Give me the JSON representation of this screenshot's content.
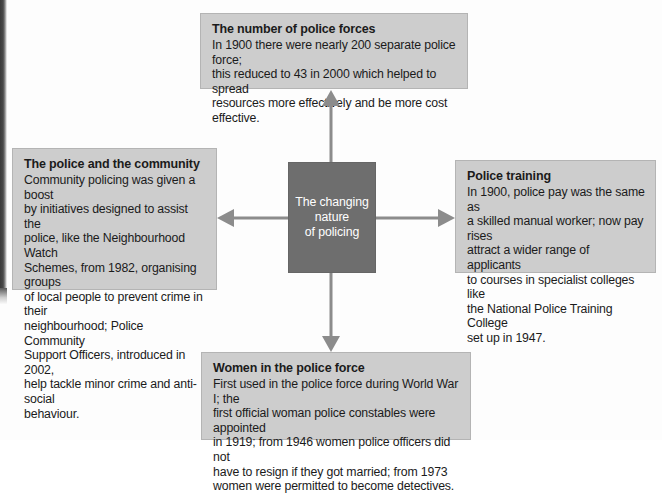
{
  "diagram": {
    "hub": {
      "label": "The changing\nnature\nof policing",
      "fill": "#6e6e6e",
      "text_color": "#ffffff"
    },
    "node_fill": "#cdcdcd",
    "arrow_color": "#8c8c8c",
    "nodes": [
      {
        "id": "number-of-police-forces",
        "title": "The number of police forces",
        "body": "In 1900 there were nearly 200 separate police force;\nthis reduced to 43 in 2000 which helped to spread\nresources more effectively and be  more cost effective."
      },
      {
        "id": "police-and-the-community",
        "title": "The police and the community",
        "body": "Community policing was given a boost\nby initiatives designed to assist the\npolice, like the Neighbourhood Watch\nSchemes, from 1982, organising groups\nof local people to prevent crime in their\nneighbourhood; Police Community\nSupport Officers, introduced in 2002,\nhelp tackle minor crime and anti-social\nbehaviour."
      },
      {
        "id": "police-training",
        "title": "Police training",
        "body": "In 1900, police pay was the same as\na skilled manual worker; now pay rises\nattract a wider range of applicants\nto courses in specialist colleges like\nthe National Police Training College\nset up in 1947."
      },
      {
        "id": "women-in-the-police-force",
        "title": "Women in the police force",
        "body": "First used in the police force during World War I; the\nfirst official woman police constables were appointed\nin 1919; from 1946 women police officers did not\nhave to resign if they got married; from 1973\nwomen were permitted to become detectives."
      }
    ],
    "arrows": [
      {
        "id": "arrow-up",
        "direction": "up"
      },
      {
        "id": "arrow-down",
        "direction": "down"
      },
      {
        "id": "arrow-left",
        "direction": "left"
      },
      {
        "id": "arrow-right",
        "direction": "right"
      }
    ]
  }
}
